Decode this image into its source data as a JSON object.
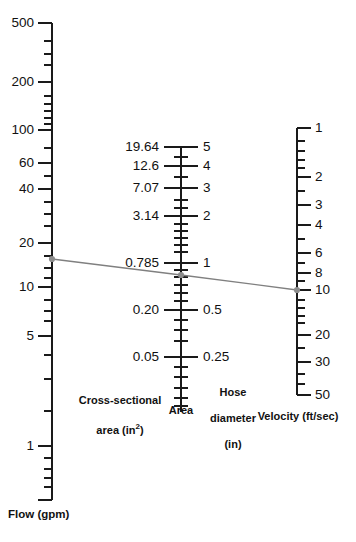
{
  "figure": {
    "type": "nomograph",
    "background_color": "#ffffff",
    "axis_color": "#1a1a1a",
    "index_line_color": "#808080",
    "marker_color": "#8c8c8c",
    "width": 356,
    "height": 542
  },
  "captions": {
    "flow": "Flow (gpm)",
    "area_left_line1": "Cross-sectional",
    "area_left_line2": "area (in²)",
    "area_right_line1": "Hose",
    "area_right_line2": "diameter",
    "area_right_line3": "(in)",
    "area_bottom": "Area",
    "velocity": "Velocity (ft/sec)"
  },
  "chart_data": {
    "type": "line",
    "title": "",
    "subtitle": "",
    "xlabel": "",
    "ylabel": "",
    "grid": false,
    "legend_position": "none",
    "axes": [
      {
        "name": "flow",
        "label": "Flow (gpm)",
        "units": "gpm",
        "scale": "log",
        "position": "left",
        "range": [
          0.5,
          560
        ],
        "labeled_ticks": [
          500,
          200,
          100,
          60,
          40,
          20,
          10,
          5,
          1
        ],
        "tick_values": [
          500,
          400,
          300,
          200,
          100,
          90,
          80,
          70,
          60,
          50,
          40,
          30,
          20,
          10,
          9,
          8,
          7,
          6,
          5,
          4,
          3,
          2,
          1,
          0.9,
          0.8,
          0.7,
          0.6
        ]
      },
      {
        "name": "area",
        "label": "Area",
        "left_label": "Cross-sectional area (in²)",
        "right_label": "Hose diameter (in)",
        "units_left": "in²",
        "units_right": "in",
        "scale": "log",
        "position": "center",
        "range": [
          0.15,
          6.0
        ],
        "pairs": [
          {
            "area": "19.64",
            "diameter": "5"
          },
          {
            "area": "12.6",
            "diameter": "4"
          },
          {
            "area": "7.07",
            "diameter": "3"
          },
          {
            "area": "3.14",
            "diameter": "2"
          },
          {
            "area": "0.785",
            "diameter": "1"
          },
          {
            "area": "0.20",
            "diameter": "0.5"
          },
          {
            "area": "0.05",
            "diameter": "0.25"
          }
        ],
        "minor_diameter_ticks": [
          4.5,
          3.5,
          2.5,
          2.25,
          1.75,
          1.5,
          1.25,
          0.9,
          0.8,
          0.7,
          0.6,
          0.45,
          0.4,
          0.35,
          0.3,
          0.22,
          0.2,
          0.18
        ]
      },
      {
        "name": "velocity",
        "label": "Velocity (ft/sec)",
        "units": "ft/sec",
        "scale": "log",
        "position": "right",
        "range": [
          0.9,
          55
        ],
        "labeled_ticks": [
          1,
          2,
          3,
          4,
          6,
          8,
          10,
          20,
          30,
          50
        ],
        "tick_values": [
          1,
          1.2,
          1.4,
          1.6,
          1.8,
          2,
          2.5,
          3,
          4,
          5,
          6,
          8,
          10,
          12,
          14,
          16,
          20,
          30,
          40,
          50
        ]
      }
    ],
    "index_line": {
      "name": "index-line",
      "style": "solid",
      "color": "#808080",
      "points": [
        {
          "axis": "flow",
          "value": 15
        },
        {
          "axis": "area",
          "value_area": 0.62,
          "value_diameter": 0.89
        },
        {
          "axis": "velocity",
          "value": 10
        }
      ],
      "markers": 3
    }
  },
  "axis_ticks_render": {
    "flow": {
      "x": 52,
      "labels": [
        {
          "text": "500",
          "y": 23
        },
        {
          "text": "200",
          "y": 82
        },
        {
          "text": "100",
          "y": 130
        },
        {
          "text": "60",
          "y": 163
        },
        {
          "text": "40",
          "y": 189
        },
        {
          "text": "20",
          "y": 243
        },
        {
          "text": "10",
          "y": 287
        },
        {
          "text": "5",
          "y": 336
        },
        {
          "text": "1",
          "y": 446
        }
      ],
      "major_y": [
        23,
        82,
        130,
        163,
        189,
        243,
        287,
        336,
        446
      ],
      "minor_y": [
        41,
        54,
        65,
        96,
        104,
        111,
        118,
        124,
        148,
        176,
        202,
        214,
        226,
        256,
        268,
        278,
        300,
        311,
        321,
        355,
        379,
        411,
        458,
        469,
        478,
        487
      ],
      "top": 23,
      "bottom": 500
    },
    "area": {
      "x": 181,
      "pairs": [
        {
          "left": "19.64",
          "right": "5",
          "y": 147
        },
        {
          "left": "12.6",
          "right": "4",
          "y": 166
        },
        {
          "left": "7.07",
          "right": "3",
          "y": 188
        },
        {
          "left": "3.14",
          "right": "2",
          "y": 216
        },
        {
          "left": "0.785",
          "right": "1",
          "y": 263
        },
        {
          "left": "0.20",
          "right": "0.5",
          "y": 310
        },
        {
          "left": "0.05",
          "right": "0.25",
          "y": 357
        }
      ],
      "minor_y": [
        157,
        177,
        200,
        208,
        224,
        231,
        238,
        245,
        252,
        270,
        277,
        285,
        293,
        301,
        320,
        330,
        341,
        367,
        377,
        388,
        398,
        406
      ],
      "top": 147,
      "bottom": 412
    },
    "velocity": {
      "x": 297,
      "labels": [
        {
          "text": "1",
          "y": 128
        },
        {
          "text": "2",
          "y": 177
        },
        {
          "text": "3",
          "y": 205
        },
        {
          "text": "4",
          "y": 225
        },
        {
          "text": "6",
          "y": 253
        },
        {
          "text": "8",
          "y": 273
        },
        {
          "text": "10",
          "y": 290
        },
        {
          "text": "20",
          "y": 335
        },
        {
          "text": "30",
          "y": 362
        },
        {
          "text": "50",
          "y": 395
        }
      ],
      "major_y": [
        128,
        177,
        205,
        225,
        253,
        273,
        290,
        335,
        362,
        395
      ],
      "minor_y": [
        141,
        151,
        160,
        168,
        191,
        239,
        263,
        281,
        300,
        308,
        316,
        323,
        348,
        374,
        384
      ],
      "top": 128,
      "bottom": 395
    },
    "index_line_render": {
      "x1": 52,
      "y1": 259,
      "x2": 181,
      "y2": 275,
      "x3": 297,
      "y3": 290
    }
  }
}
